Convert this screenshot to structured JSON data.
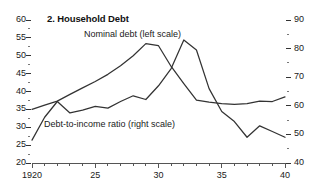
{
  "chart_data": {
    "type": "line",
    "title": "2. Household Debt",
    "xlabel": "",
    "ylabel": "",
    "grid": false,
    "legend_position": "inline-annotation",
    "x": [
      1920,
      1921,
      1922,
      1923,
      1924,
      1925,
      1926,
      1927,
      1928,
      1929,
      1930,
      1931,
      1932,
      1933,
      1934,
      1935,
      1936,
      1937,
      1938,
      1939,
      1940
    ],
    "xlim": [
      1920,
      1940
    ],
    "x_tick_labels": [
      "1920",
      "25",
      "30",
      "35",
      "40"
    ],
    "x_tick_label_values": [
      1920,
      1925,
      1930,
      1935,
      1940
    ],
    "x_minor_tick_step": 1,
    "left_axis": {
      "label": "Nominal debt (left scale)",
      "ylim": [
        20,
        60
      ],
      "tick_labels": [
        "60",
        "55",
        "50",
        "45",
        "40",
        "35",
        "30",
        "25",
        "20"
      ],
      "tick_values": [
        60,
        55,
        50,
        45,
        40,
        35,
        30,
        25,
        20
      ],
      "minor_tick_step": 2.5
    },
    "right_axis": {
      "label": "Debt-to-income ratio (right scale)",
      "ylim": [
        40,
        90
      ],
      "tick_labels": [
        "90",
        "80",
        "70",
        "60",
        "50",
        "40"
      ],
      "tick_values": [
        90,
        80,
        70,
        60,
        50,
        40
      ],
      "minor_tick_step": 5
    },
    "series": [
      {
        "name": "Nominal debt (left scale)",
        "axis": "left",
        "color": "#333333",
        "values": [
          35.0,
          36.2,
          37.3,
          39.2,
          41.0,
          42.8,
          44.8,
          47.2,
          50.0,
          53.4,
          52.8,
          47.0,
          42.2,
          37.6,
          37.0,
          36.6,
          36.4,
          36.6,
          37.3,
          37.2,
          38.5
        ]
      },
      {
        "name": "Debt-to-income ratio (right scale)",
        "axis": "right",
        "color": "#333333",
        "values": [
          48.0,
          56.0,
          61.5,
          57.5,
          58.5,
          59.8,
          59.2,
          61.5,
          63.5,
          62.2,
          67.0,
          73.0,
          83.0,
          79.5,
          66.0,
          58.0,
          54.5,
          49.0,
          53.0,
          51.0,
          49.0
        ]
      }
    ]
  },
  "annotations": {
    "nominal_debt": "Nominal debt (left scale)",
    "debt_to_income": "Debt-to-income ratio (right scale)"
  }
}
